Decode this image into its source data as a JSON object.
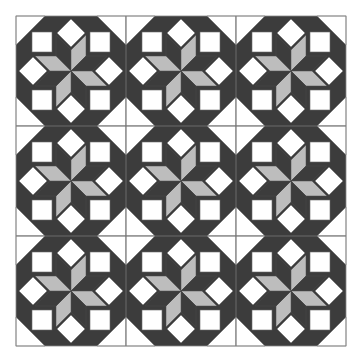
{
  "canvas": {
    "width": 360,
    "height": 358,
    "background": "#ffffff"
  },
  "quilt": {
    "name": "Eight-point star quilt",
    "origin": [
      16,
      16
    ],
    "block_size": 110,
    "rows": 3,
    "cols": 3,
    "colors": {
      "background_dark": "#3c3c3c",
      "star_dark": "#3c3c3c",
      "star_light": "#bdbdbd",
      "white": "#ffffff",
      "outline": "#6a6a6a",
      "grid_line": "#777777",
      "border": "#888888"
    },
    "block": {
      "corner_triangles": [
        [
          [
            0,
            0
          ],
          [
            29,
            0
          ],
          [
            0,
            29
          ]
        ],
        [
          [
            110,
            0
          ],
          [
            81,
            0
          ],
          [
            110,
            29
          ]
        ],
        [
          [
            0,
            110
          ],
          [
            29,
            110
          ],
          [
            0,
            81
          ]
        ],
        [
          [
            110,
            110
          ],
          [
            81,
            110
          ],
          [
            110,
            81
          ]
        ]
      ],
      "white_squares": [
        [
          16,
          16,
          20,
          20
        ],
        [
          74,
          16,
          20,
          20
        ],
        [
          16,
          74,
          20,
          20
        ],
        [
          74,
          74,
          20,
          20
        ]
      ],
      "white_diamonds": [
        {
          "cx": 55,
          "cy": 17,
          "r": 14
        },
        {
          "cx": 93,
          "cy": 55,
          "r": 14
        },
        {
          "cx": 55,
          "cy": 93,
          "r": 14
        },
        {
          "cx": 17,
          "cy": 55,
          "r": 14
        }
      ],
      "star_diamonds": [
        {
          "dir": "NNW",
          "tone": "star_dark",
          "pts": [
            [
              55,
              55
            ],
            [
              40,
              40
            ],
            [
              40,
              19
            ],
            [
              55,
              34
            ]
          ]
        },
        {
          "dir": "NNE",
          "tone": "star_light",
          "pts": [
            [
              55,
              55
            ],
            [
              55,
              34
            ],
            [
              70,
              19
            ],
            [
              70,
              40
            ]
          ]
        },
        {
          "dir": "ENE",
          "tone": "star_dark",
          "pts": [
            [
              55,
              55
            ],
            [
              70,
              40
            ],
            [
              91,
              40
            ],
            [
              76,
              55
            ]
          ]
        },
        {
          "dir": "ESE",
          "tone": "star_light",
          "pts": [
            [
              55,
              55
            ],
            [
              76,
              55
            ],
            [
              91,
              70
            ],
            [
              70,
              70
            ]
          ]
        },
        {
          "dir": "SSE",
          "tone": "star_dark",
          "pts": [
            [
              55,
              55
            ],
            [
              70,
              70
            ],
            [
              70,
              91
            ],
            [
              55,
              76
            ]
          ]
        },
        {
          "dir": "SSW",
          "tone": "star_light",
          "pts": [
            [
              55,
              55
            ],
            [
              55,
              76
            ],
            [
              40,
              91
            ],
            [
              40,
              70
            ]
          ]
        },
        {
          "dir": "WSW",
          "tone": "star_dark",
          "pts": [
            [
              55,
              55
            ],
            [
              40,
              70
            ],
            [
              19,
              70
            ],
            [
              34,
              55
            ]
          ]
        },
        {
          "dir": "WNW",
          "tone": "star_light",
          "pts": [
            [
              55,
              55
            ],
            [
              34,
              55
            ],
            [
              19,
              40
            ],
            [
              40,
              40
            ]
          ]
        }
      ]
    }
  }
}
